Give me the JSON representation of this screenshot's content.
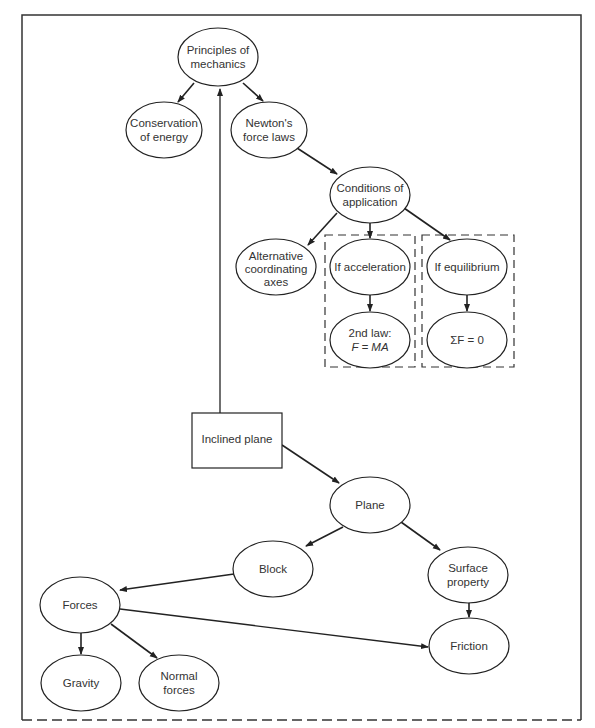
{
  "diagram": {
    "type": "concept-map",
    "frame": {
      "top_left_right": "solid",
      "bottom": "dashed"
    },
    "nodes": {
      "principles": {
        "line1": "Principles of",
        "line2": "mechanics",
        "shape": "ellipse"
      },
      "conservation": {
        "line1": "Conservation",
        "line2": "of energy",
        "shape": "ellipse"
      },
      "newton": {
        "line1": "Newton's",
        "line2": "force laws",
        "shape": "ellipse"
      },
      "conditions": {
        "line1": "Conditions of",
        "line2": "application",
        "shape": "ellipse"
      },
      "alternative": {
        "line1": "Alternative",
        "line2": "coordinating",
        "line3": "axes",
        "shape": "ellipse"
      },
      "if_acceleration": {
        "line1": "If acceleration",
        "shape": "ellipse"
      },
      "second_law": {
        "line1": "2nd law:",
        "line2": "F = MA",
        "shape": "ellipse"
      },
      "if_equilibrium": {
        "line1": "If equilibrium",
        "shape": "ellipse"
      },
      "sum_f": {
        "line1": "ΣF = 0",
        "shape": "ellipse"
      },
      "inclined_plane": {
        "line1": "Inclined plane",
        "shape": "rectangle"
      },
      "plane": {
        "line1": "Plane",
        "shape": "ellipse"
      },
      "block": {
        "line1": "Block",
        "shape": "ellipse"
      },
      "surface_property": {
        "line1": "Surface",
        "line2": "property",
        "shape": "ellipse"
      },
      "forces": {
        "line1": "Forces",
        "shape": "ellipse"
      },
      "friction": {
        "line1": "Friction",
        "shape": "ellipse"
      },
      "gravity": {
        "line1": "Gravity",
        "shape": "ellipse"
      },
      "normal_forces": {
        "line1": "Normal",
        "line2": "forces",
        "shape": "ellipse"
      }
    },
    "edges": [
      {
        "from": "principles",
        "to": "conservation"
      },
      {
        "from": "principles",
        "to": "newton"
      },
      {
        "from": "newton",
        "to": "conditions"
      },
      {
        "from": "conditions",
        "to": "alternative"
      },
      {
        "from": "conditions",
        "to": "if_acceleration"
      },
      {
        "from": "conditions",
        "to": "if_equilibrium"
      },
      {
        "from": "if_acceleration",
        "to": "second_law"
      },
      {
        "from": "if_equilibrium",
        "to": "sum_f"
      },
      {
        "from": "inclined_plane",
        "to": "principles"
      },
      {
        "from": "inclined_plane",
        "to": "plane"
      },
      {
        "from": "plane",
        "to": "block"
      },
      {
        "from": "plane",
        "to": "surface_property"
      },
      {
        "from": "block",
        "to": "forces"
      },
      {
        "from": "surface_property",
        "to": "friction"
      },
      {
        "from": "forces",
        "to": "friction"
      },
      {
        "from": "forces",
        "to": "gravity"
      },
      {
        "from": "forces",
        "to": "normal_forces"
      }
    ],
    "groups": [
      {
        "name": "acceleration-group",
        "members": [
          "if_acceleration",
          "second_law"
        ],
        "style": "dashed"
      },
      {
        "name": "equilibrium-group",
        "members": [
          "if_equilibrium",
          "sum_f"
        ],
        "style": "dashed"
      }
    ],
    "colors": {
      "stroke": "#222222",
      "text": "#333333",
      "background": "#ffffff"
    }
  }
}
